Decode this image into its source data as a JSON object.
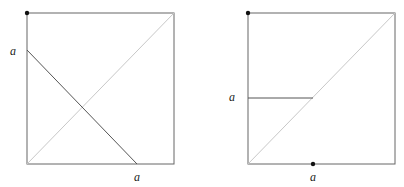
{
  "diagrams": [
    {
      "name": "left-square",
      "square": {
        "x": 27,
        "y": 13,
        "size": 151
      },
      "diagonal_color": "#c8c8c8",
      "line_color": "#555555",
      "dot": {
        "x": 27,
        "y": 13
      },
      "segment": {
        "x1": 27,
        "y1": 50,
        "x2": 137,
        "y2": 164
      },
      "labels": [
        {
          "text": "a",
          "x": 10,
          "y": 55
        },
        {
          "text": "a",
          "x": 134,
          "y": 181
        }
      ]
    },
    {
      "name": "right-square",
      "square": {
        "x": 248,
        "y": 13,
        "size": 147
      },
      "diagonal_color": "#c8c8c8",
      "line_color": "#555555",
      "dots": [
        {
          "x": 248,
          "y": 13
        },
        {
          "x": 313,
          "y": 164
        }
      ],
      "segment": {
        "x1": 248,
        "y1": 98,
        "x2": 313,
        "y2": 98
      },
      "labels": [
        {
          "text": "a",
          "x": 229,
          "y": 101
        },
        {
          "text": "a",
          "x": 310,
          "y": 181
        }
      ]
    }
  ]
}
